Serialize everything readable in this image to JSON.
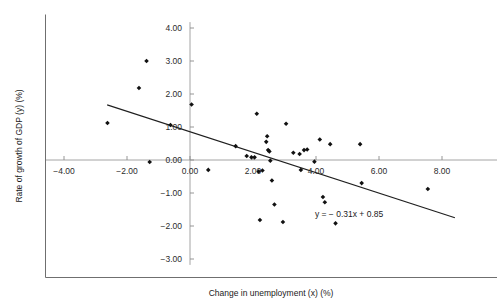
{
  "chart_data": {
    "type": "scatter",
    "title": "",
    "xlabel": "Change in unemployment (x) (%)",
    "ylabel": "Rate of growth of GDP (y) (%)",
    "xlim": [
      -5.0,
      8.8
    ],
    "ylim": [
      -3.3,
      4.3
    ],
    "grid": false,
    "legend": null,
    "xticks": [
      -4.0,
      -2.0,
      0.0,
      2.0,
      4.0,
      6.0,
      8.0
    ],
    "xtick_labels": [
      "−4.00",
      "−2.00",
      "0.00",
      "2.00",
      "4.00",
      "6.00",
      "8.00"
    ],
    "yticks": [
      -3.0,
      -2.0,
      -1.0,
      0.0,
      1.0,
      2.0,
      3.0,
      4.0
    ],
    "ytick_labels": [
      "−3.00",
      "−2.00",
      "−1.00",
      "0.00",
      "1.00",
      "2.00",
      "3.00",
      "4.00"
    ],
    "annotations": [
      {
        "text": "y = − 0.31x + 0.85",
        "x": 5.05,
        "y": -1.72
      }
    ],
    "trendline": {
      "label": "y = − 0.31x + 0.85",
      "slope": -0.31,
      "intercept": 0.85,
      "x_start": -2.63,
      "x_end": 8.41,
      "y_start": 1.67,
      "y_end": -1.75
    },
    "points": [
      {
        "x": -2.62,
        "y": 1.12
      },
      {
        "x": -1.62,
        "y": 2.18
      },
      {
        "x": -1.38,
        "y": 3.0
      },
      {
        "x": -1.28,
        "y": -0.06
      },
      {
        "x": -0.62,
        "y": 1.06
      },
      {
        "x": 0.05,
        "y": 1.68
      },
      {
        "x": 0.58,
        "y": -0.3
      },
      {
        "x": 1.45,
        "y": 0.42
      },
      {
        "x": 1.8,
        "y": 0.12
      },
      {
        "x": 1.95,
        "y": 0.08
      },
      {
        "x": 2.05,
        "y": 0.08
      },
      {
        "x": 2.12,
        "y": 1.4
      },
      {
        "x": 2.18,
        "y": -0.35
      },
      {
        "x": 2.22,
        "y": -1.82
      },
      {
        "x": 2.3,
        "y": -0.32
      },
      {
        "x": 2.42,
        "y": 0.55
      },
      {
        "x": 2.45,
        "y": 0.72
      },
      {
        "x": 2.48,
        "y": 0.3
      },
      {
        "x": 2.52,
        "y": 0.26
      },
      {
        "x": 2.55,
        "y": -0.02
      },
      {
        "x": 2.6,
        "y": -0.62
      },
      {
        "x": 2.68,
        "y": -1.35
      },
      {
        "x": 2.95,
        "y": -1.88
      },
      {
        "x": 3.05,
        "y": 1.1
      },
      {
        "x": 3.28,
        "y": 0.22
      },
      {
        "x": 3.48,
        "y": 0.18
      },
      {
        "x": 3.52,
        "y": -0.3
      },
      {
        "x": 3.62,
        "y": 0.3
      },
      {
        "x": 3.72,
        "y": 0.32
      },
      {
        "x": 3.95,
        "y": -0.05
      },
      {
        "x": 4.12,
        "y": 0.62
      },
      {
        "x": 4.22,
        "y": -1.12
      },
      {
        "x": 4.28,
        "y": -1.28
      },
      {
        "x": 4.45,
        "y": 0.48
      },
      {
        "x": 4.62,
        "y": -1.92
      },
      {
        "x": 5.4,
        "y": 0.48
      },
      {
        "x": 5.45,
        "y": -0.7
      },
      {
        "x": 7.55,
        "y": -0.88
      }
    ]
  },
  "figure": {
    "tick_mark_color": "#8a8a8a",
    "point_color": "#111111",
    "line_color": "#1f1f1f",
    "frame_color": "#6f6f6f"
  }
}
